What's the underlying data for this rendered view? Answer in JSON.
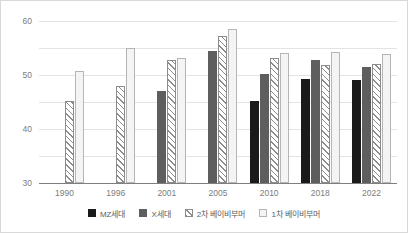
{
  "chart_data": {
    "type": "bar",
    "title": "",
    "subtitle": "",
    "xlabel": "",
    "ylabel": "",
    "ylim": [
      0,
      60
    ],
    "yticks": [
      0,
      10,
      20,
      30,
      40,
      50,
      60
    ],
    "grid": true,
    "legend_position": "bottom",
    "categories": [
      "1990",
      "1996",
      "2001",
      "2005",
      "2010",
      "2018",
      "2022"
    ],
    "series": [
      {
        "name": "MZ세대",
        "color": "#1a1a1a",
        "pattern": "solid",
        "values": [
          null,
          null,
          null,
          null,
          30.3,
          38.6,
          38.1
        ]
      },
      {
        "name": "X세대",
        "color": "#5e5e5e",
        "pattern": "solid",
        "values": [
          null,
          null,
          33.9,
          49.0,
          40.4,
          45.5,
          43.0
        ]
      },
      {
        "name": "2차 베이비부머",
        "color": "#8c8c8c",
        "pattern": "diagonal-hatch",
        "values": [
          30.3,
          36.0,
          45.6,
          54.6,
          46.2,
          43.6,
          44.1
        ]
      },
      {
        "name": "1차 베이비부머",
        "color": "#f4f4f4",
        "pattern": "outline",
        "values": [
          41.4,
          50.1,
          46.4,
          56.9,
          48.3,
          48.4,
          47.6
        ]
      }
    ]
  },
  "axis": {
    "y_tick_labels": [
      "60",
      "50",
      "40",
      "30",
      "20",
      "10",
      "0"
    ],
    "x_tick_labels": [
      "1990",
      "1996",
      "2001",
      "2005",
      "2010",
      "2018",
      "2022"
    ]
  },
  "legend": {
    "items": [
      {
        "label": "MZ세대"
      },
      {
        "label": "X세대"
      },
      {
        "label": "2차 베이비부머"
      },
      {
        "label": "1차 베이비부머"
      }
    ]
  }
}
